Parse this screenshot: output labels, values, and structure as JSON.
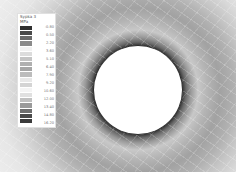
{
  "figure": {
    "type": "fem-contour-plot",
    "hole": {
      "center_px": [
        138,
        90
      ],
      "radius_px": 44
    }
  },
  "legend": {
    "title_line1": "Sypka 3",
    "title_line2": "MPa",
    "labels": [
      "-0.80",
      "0.50",
      "2.20",
      "3.60",
      "5.10",
      "6.40",
      "7.90",
      "9.20",
      "10.60",
      "12.00",
      "13.40",
      "14.80",
      "16.20"
    ],
    "colors": [
      "#2f2f2f",
      "#4a4a4a",
      "#6a6a6a",
      "#8a8a8a",
      "#f2f2f2",
      "#dcdcdc",
      "#c4c4c4",
      "#b0b0b0",
      "#a6a6a6",
      "#bcbcbc",
      "#e8e8e8",
      "#d4d4d4",
      "#f4f4f4",
      "#e0e0e0",
      "#c0c0c0",
      "#9a9a9a",
      "#6e6e6e",
      "#4a4a4a",
      "#3a3a3a"
    ]
  }
}
